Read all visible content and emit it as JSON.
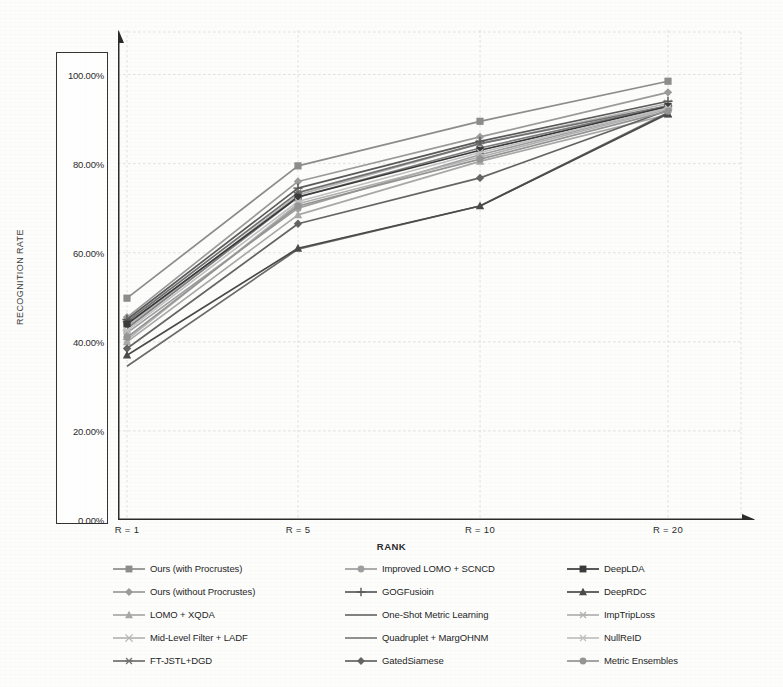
{
  "chart_data": {
    "type": "line",
    "title": "",
    "xlabel": "RANK",
    "ylabel": "RECOGNITION RATE",
    "categories": [
      "R = 1",
      "R = 5",
      "R = 10",
      "R = 20"
    ],
    "x_values": [
      1,
      5,
      10,
      20
    ],
    "ytick_labels": [
      "0.00%",
      "20.00%",
      "40.00%",
      "60.00%",
      "80.00%",
      "100.00%"
    ],
    "ytick_values": [
      0,
      20,
      40,
      60,
      80,
      100
    ],
    "ylim": [
      0,
      110
    ],
    "grid": true,
    "legend_position": "bottom",
    "legend_columns": 3,
    "series": [
      {
        "name": "Ours (with Procrustes)",
        "values": [
          49.8,
          79.5,
          89.5,
          98.5
        ],
        "color": "#8c8c8c",
        "marker": "square"
      },
      {
        "name": "Ours (without Procrustes)",
        "values": [
          45.5,
          76.0,
          86.0,
          96.0
        ],
        "color": "#9a9a9a",
        "marker": "diamond"
      },
      {
        "name": "LOMO + XQDA",
        "values": [
          40.0,
          68.5,
          80.5,
          91.0
        ],
        "color": "#a8a8a8",
        "marker": "triangle"
      },
      {
        "name": "Mid-Level Filter + LADF",
        "values": [
          43.5,
          73.0,
          84.5,
          93.5
        ],
        "color": "#b5b5b5",
        "marker": "cross"
      },
      {
        "name": "FT-JSTL+DGD",
        "values": [
          44.5,
          73.5,
          84.5,
          93.0
        ],
        "color": "#707070",
        "marker": "asterisk"
      },
      {
        "name": "Improved LOMO + SCNCD",
        "values": [
          42.0,
          70.0,
          82.0,
          92.5
        ],
        "color": "#9e9e9e",
        "marker": "circle"
      },
      {
        "name": "GOGFusioin",
        "values": [
          45.0,
          74.5,
          85.0,
          94.0
        ],
        "color": "#5a5a5a",
        "marker": "plus"
      },
      {
        "name": "One-Shot Metric Learning",
        "values": [
          34.5,
          60.8,
          70.5,
          91.5
        ],
        "color": "#6b6b6b",
        "marker": "none"
      },
      {
        "name": "Quadruplet + MargOHNM",
        "values": [
          43.0,
          72.5,
          83.5,
          93.0
        ],
        "color": "#7d7d7d",
        "marker": "none"
      },
      {
        "name": "GatedSiamese",
        "values": [
          38.5,
          66.5,
          76.8,
          92.0
        ],
        "color": "#646464",
        "marker": "diamond"
      },
      {
        "name": "DeepLDA",
        "values": [
          44.0,
          72.5,
          83.0,
          92.8
        ],
        "color": "#3a3a3a",
        "marker": "square"
      },
      {
        "name": "DeepRDC",
        "values": [
          37.0,
          61.0,
          70.5,
          91.2
        ],
        "color": "#4a4a4a",
        "marker": "triangle"
      },
      {
        "name": "ImpTripLoss",
        "values": [
          40.5,
          71.0,
          81.5,
          92.2
        ],
        "color": "#b0b0b0",
        "marker": "asterisk"
      },
      {
        "name": "NullReID",
        "values": [
          42.5,
          71.5,
          82.5,
          92.5
        ],
        "color": "#c0c0c0",
        "marker": "asterisk"
      },
      {
        "name": "Metric Ensembles",
        "values": [
          41.0,
          70.5,
          81.0,
          91.8
        ],
        "color": "#949494",
        "marker": "circle"
      }
    ]
  }
}
